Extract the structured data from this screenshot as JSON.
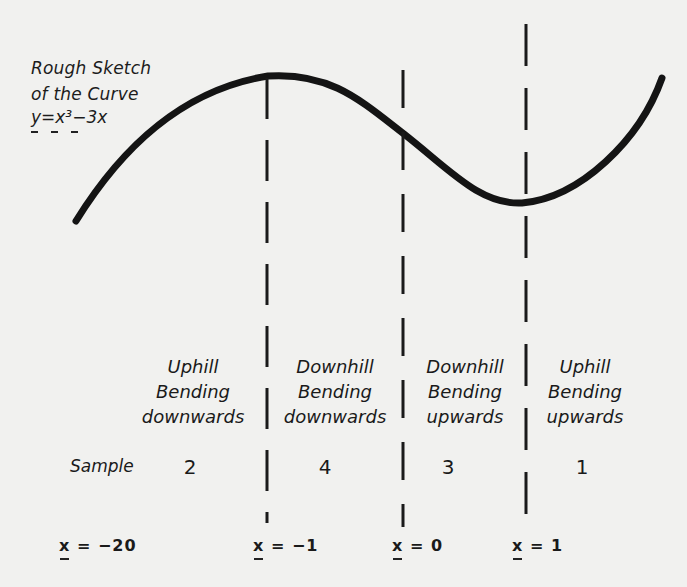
{
  "diagram": {
    "title_lines": [
      "Rough Sketch",
      "of the Curve"
    ],
    "equation": "y=x³−3x",
    "curve": {
      "function": "y = x^3 - 3x",
      "shape": "cubic with local maximum at x=-1 and local minimum at x=1, inflection at x=0",
      "stroke_color": "#111111"
    },
    "regions": [
      {
        "line1": "Uphill",
        "line2": "Bending",
        "line3": "downwards",
        "sample": "2"
      },
      {
        "line1": "Downhill",
        "line2": "Bending",
        "line3": "downwards",
        "sample": "4"
      },
      {
        "line1": "Downhill",
        "line2": "Bending",
        "line3": "upwards",
        "sample": "3"
      },
      {
        "line1": "Uphill",
        "line2": "Bending",
        "line3": "upwards",
        "sample": "1"
      }
    ],
    "sample_label": "Sample",
    "x_markers": [
      {
        "var": "x",
        "op": "=",
        "value": "−20"
      },
      {
        "var": "x",
        "op": "=",
        "value": "−1"
      },
      {
        "var": "x",
        "op": "=",
        "value": "0"
      },
      {
        "var": "x",
        "op": "=",
        "value": "1"
      }
    ],
    "dividers": [
      "x=-1",
      "x=0",
      "x=1"
    ],
    "colors": {
      "background": "#f1f1ef",
      "ink": "#1a1a1a"
    }
  }
}
